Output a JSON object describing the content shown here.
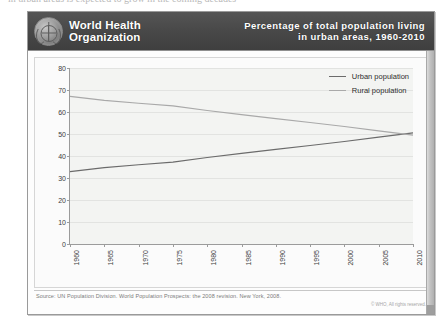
{
  "page": {
    "ghost_top_line": "in urban areas is expected to grow in the coming decades"
  },
  "header": {
    "logo_name": "who-emblem",
    "organization_line1": "World Health",
    "organization_line2": "Organization",
    "title_line1": "Percentage of total population living",
    "title_line2": "in urban areas, 1960-2010",
    "background_color": "#4a4a4a",
    "text_color": "#ffffff"
  },
  "legend": {
    "position": "top-right",
    "entries": [
      {
        "label": "Urban population",
        "color": "#6b6b6b"
      },
      {
        "label": "Rural population",
        "color": "#a9a9a9"
      }
    ]
  },
  "footer": {
    "source": "Source: UN Population Division. World Population Prospects: the 2008 revision. New York, 2008.",
    "copyright": "© WHO, All rights reserved."
  },
  "chart_data": {
    "type": "line",
    "title": "Percentage of total population living in urban areas, 1960-2010",
    "xlabel": "",
    "ylabel": "Percentage of global population (%)",
    "x": [
      1960,
      1965,
      1970,
      1975,
      1980,
      1985,
      1990,
      1995,
      2000,
      2005,
      2010
    ],
    "xtick_labels": [
      "1960",
      "1965",
      "1970",
      "1975",
      "1980",
      "1985",
      "1990",
      "1995",
      "2000",
      "2005",
      "2010"
    ],
    "ytick_labels": [
      "0",
      "10",
      "20",
      "30",
      "40",
      "50",
      "60",
      "70",
      "80"
    ],
    "ylim": [
      0,
      80
    ],
    "xlim": [
      1960,
      2010
    ],
    "grid": true,
    "series": [
      {
        "name": "Urban population",
        "color": "#6b6b6b",
        "values": [
          32.9,
          34.7,
          36.0,
          37.2,
          39.3,
          41.2,
          43.0,
          44.8,
          46.6,
          48.6,
          50.5
        ]
      },
      {
        "name": "Rural population",
        "color": "#a9a9a9",
        "values": [
          67.1,
          65.3,
          64.0,
          62.8,
          60.7,
          58.8,
          57.0,
          55.2,
          53.4,
          51.4,
          49.5
        ]
      }
    ],
    "annotations": [
      "Urban and rural shares cross at approximately 50% near 2007"
    ]
  }
}
